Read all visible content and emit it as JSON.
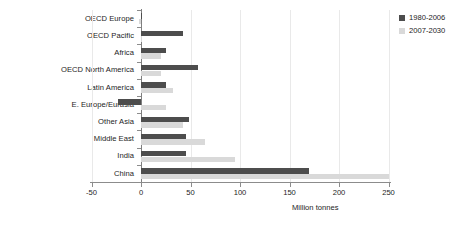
{
  "chart_data": {
    "type": "bar",
    "orientation": "horizontal",
    "title": "",
    "subtitle": "",
    "xlabel": "Million tonnes",
    "ylabel": "",
    "xlim": [
      -50,
      250
    ],
    "xticks": [
      -50,
      0,
      50,
      100,
      150,
      200,
      250
    ],
    "xtick_labels": [
      "-50",
      "0",
      "50",
      "100",
      "150",
      "200",
      "250"
    ],
    "grid": true,
    "legend_position": "top-right",
    "categories": [
      "OECD Europe",
      "OECD Pacific",
      "Africa",
      "OECD North America",
      "Latin America",
      "E. Europe/Eurasia",
      "Other Asia",
      "Middle East",
      "India",
      "China"
    ],
    "series": [
      {
        "name": "1980-2006",
        "color": "#4d4d4d",
        "values": [
          1,
          42,
          25,
          58,
          25,
          -23,
          48,
          45,
          45,
          170
        ]
      },
      {
        "name": "2007-2030",
        "color": "#d9d9d9",
        "values": [
          -2,
          1,
          20,
          20,
          32,
          25,
          42,
          65,
          95,
          250
        ]
      }
    ]
  },
  "legend": {
    "entries": [
      {
        "label": "1980-2006",
        "color": "#4d4d4d"
      },
      {
        "label": "2007-2030",
        "color": "#d9d9d9"
      }
    ]
  },
  "axis": {
    "x_title": "Million tonnes"
  }
}
